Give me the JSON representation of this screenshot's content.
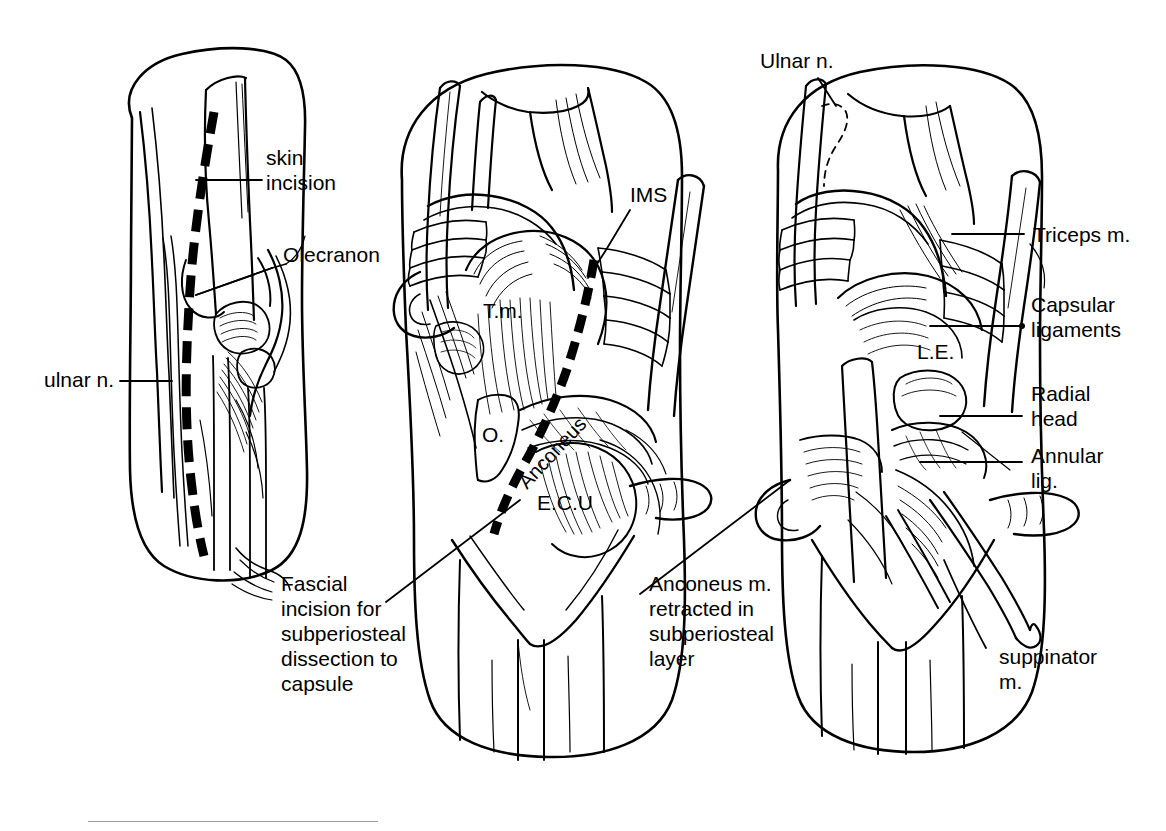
{
  "figure": {
    "type": "anatomical-line-illustration",
    "panel_count": 3,
    "background_color": "#ffffff",
    "ink_color": "#000000",
    "rule_color": "#9a9a9a"
  },
  "panels": [
    {
      "id": "panel-left",
      "caption": "Skin incision over olecranon with ulnar nerve shown",
      "labels": [
        {
          "key": "skin_incision",
          "text": "skin\nincision"
        },
        {
          "key": "olecranon",
          "text": "Olecranon"
        },
        {
          "key": "ulnar_n",
          "text": "ulnar n."
        }
      ]
    },
    {
      "id": "panel-middle",
      "caption": "Fascial incision and superficial musculature exposed",
      "labels": [
        {
          "key": "ims",
          "text": "IMS"
        },
        {
          "key": "tm",
          "text": "T.m."
        },
        {
          "key": "o",
          "text": "O."
        },
        {
          "key": "anconeus",
          "text": "Anconeus"
        },
        {
          "key": "ecu",
          "text": "E.C.U"
        },
        {
          "key": "fascial_incision",
          "text": "Fascial\nincision for\nsubperiosteal\ndissection to\ncapsule"
        }
      ]
    },
    {
      "id": "panel-right",
      "caption": "Deep exposure of capsule, radial head and annular ligament",
      "labels": [
        {
          "key": "ulnar_n",
          "text": "Ulnar n."
        },
        {
          "key": "triceps_m",
          "text": "Triceps m."
        },
        {
          "key": "capsular_ligaments",
          "text": "Capsular\nligaments"
        },
        {
          "key": "le",
          "text": "L.E."
        },
        {
          "key": "radial_head",
          "text": "Radial\nhead"
        },
        {
          "key": "annular_lig",
          "text": "Annular\nlig."
        },
        {
          "key": "suppinator_m",
          "text": "suppinator\nm."
        },
        {
          "key": "anconeus_retracted",
          "text": "Anconeus m.\nretracted in\nsubperiosteal\nlayer"
        }
      ]
    }
  ],
  "text": {
    "skin_incision": "skin\nincision",
    "olecranon": "Olecranon",
    "ulnar_n_lower": "ulnar n.",
    "ims": "IMS",
    "tm": "T.m.",
    "o": "O.",
    "anconeus": "Anconeus",
    "ecu": "E.C.U",
    "fascial_incision": "Fascial\nincision for\nsubperiosteal\ndissection to\ncapsule",
    "ulnar_n_upper": "Ulnar n.",
    "triceps_m": "Triceps m.",
    "capsular_ligaments": "Capsular\nligaments",
    "le": "L.E.",
    "radial_head": "Radial\nhead",
    "annular_lig": "Annular\nlig.",
    "suppinator_m": "suppinator\nm.",
    "anconeus_retracted": "Anconeus m.\nretracted in\nsubperiosteal\nlayer"
  },
  "abbreviations": {
    "IMS": "intermuscular septum",
    "T.m.": "Triceps muscle",
    "O.": "Olecranon",
    "E.C.U": "Extensor carpi ulnaris",
    "L.E.": "Lateral epicondyle"
  }
}
